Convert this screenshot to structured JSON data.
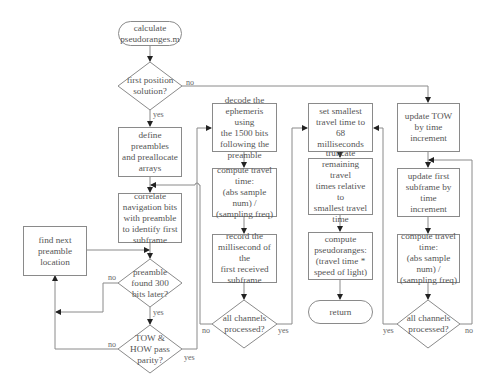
{
  "diagram": {
    "type": "flowchart",
    "nodes": {
      "start": {
        "shape": "terminal",
        "text": "calculate\npseudoranges.m"
      },
      "first_position": {
        "shape": "decision",
        "text": "first position\nsolution?"
      },
      "define_preambles": {
        "shape": "process",
        "text": "define preambles\nand preallocate\narrays"
      },
      "correlate": {
        "shape": "process",
        "text": "correlate\nnavigation bits\nwith preamble\nto identify first\nsubframe"
      },
      "find_next": {
        "shape": "process",
        "text": "find next\npreamble\nlocation"
      },
      "preamble_found": {
        "shape": "decision",
        "text": "preamble\nfound 300\nbits later?"
      },
      "tow_how_parity": {
        "shape": "decision",
        "text": "TOW &\nHOW pass\nparity?"
      },
      "decode_ephemeris": {
        "shape": "process",
        "text": "decode the\nephemeris using\nthe 1500 bits\nfollowing the\npreamble"
      },
      "compute_travel_1": {
        "shape": "process",
        "text": "compute travel\ntime:\n(abs sample num) /\n(sampling freq)"
      },
      "record_ms": {
        "shape": "process",
        "text": "record the\nmillisecond of the\nfirst received\nsubframe"
      },
      "all_channels_1": {
        "shape": "decision",
        "text": "all channels\nprocessed?"
      },
      "set_smallest": {
        "shape": "process",
        "text": "set smallest\ntravel time to 68\nmilliseconds"
      },
      "truncate": {
        "shape": "process",
        "text": "truncate\nremaining travel\ntimes relative to\nsmallest travel\ntime"
      },
      "compute_pseudoranges": {
        "shape": "process",
        "text": "compute\npseudoranges:\n(travel time *\nspeed of light)"
      },
      "return": {
        "shape": "terminal",
        "text": "return"
      },
      "update_tow": {
        "shape": "process",
        "text": "update TOW\nby time\nincrement"
      },
      "update_first_subframe": {
        "shape": "process",
        "text": "update first\nsubframe by time\nincrement"
      },
      "compute_travel_2": {
        "shape": "process",
        "text": "compute travel\ntime:\n(abs sample num) /\n(sampling freq)"
      },
      "all_channels_2": {
        "shape": "decision",
        "text": "all channels\nprocessed?"
      }
    },
    "edge_labels": {
      "first_position_no": "no",
      "first_position_yes": "yes",
      "preamble_found_no": "no",
      "preamble_found_yes": "yes",
      "tow_how_no": "no",
      "tow_how_yes": "yes",
      "all_channels_1_no": "no",
      "all_channels_1_yes": "yes",
      "all_channels_2_yes": "yes",
      "all_channels_2_no": "no"
    },
    "colors": {
      "line": "#8a8a8a",
      "text": "#555555",
      "background": "#ffffff"
    }
  }
}
